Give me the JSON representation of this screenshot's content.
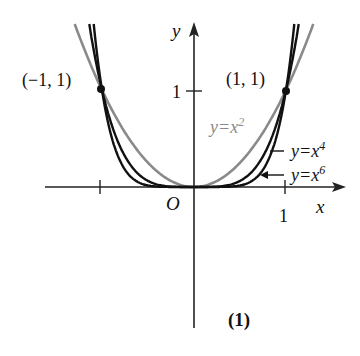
{
  "figure": {
    "caption": "(1)",
    "origin_label": "O",
    "x_axis_label": "x",
    "y_axis_label": "y",
    "x_tick_label": "1",
    "y_tick_label": "1",
    "point_left_label": "(−1, 1)",
    "point_right_label": "(1, 1)",
    "colors": {
      "x2": "#8a8a8a",
      "x4": "#111111",
      "x6": "#111111",
      "axes": "#222222"
    }
  },
  "curves": [
    {
      "name": "x2",
      "label_prefix": "y=x",
      "exponent": "2"
    },
    {
      "name": "x4",
      "label_prefix": "y=x",
      "exponent": "4"
    },
    {
      "name": "x6",
      "label_prefix": "y=x",
      "exponent": "6"
    }
  ],
  "chart_data": {
    "type": "line",
    "title": "",
    "xlabel": "x",
    "ylabel": "y",
    "xlim": [
      -1.05,
      1.6
    ],
    "ylim": [
      -1.5,
      1.7
    ],
    "series": [
      {
        "name": "y=x^2",
        "x": [
          -1.3,
          -1,
          -0.5,
          0,
          0.5,
          1,
          1.3
        ],
        "values": [
          1.69,
          1,
          0.25,
          0,
          0.25,
          1,
          1.69
        ]
      },
      {
        "name": "y=x^4",
        "x": [
          -1.14,
          -1,
          -0.5,
          0,
          0.5,
          1,
          1.14
        ],
        "values": [
          1.69,
          1,
          0.0625,
          0,
          0.0625,
          1,
          1.69
        ]
      },
      {
        "name": "y=x^6",
        "x": [
          -1.09,
          -1,
          -0.5,
          0,
          0.5,
          1,
          1.09
        ],
        "values": [
          1.68,
          1,
          0.0156,
          0,
          0.0156,
          1,
          1.68
        ]
      }
    ],
    "points": [
      {
        "x": -1,
        "y": 1,
        "label": "(-1, 1)"
      },
      {
        "x": 1,
        "y": 1,
        "label": "(1, 1)"
      }
    ],
    "ticks": {
      "x": [
        -1,
        1
      ],
      "y": [
        1
      ]
    },
    "grid": false,
    "legend": "inline labels"
  }
}
